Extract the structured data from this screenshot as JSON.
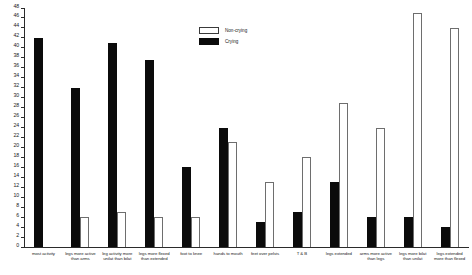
{
  "chart_data": {
    "type": "bar",
    "title": "",
    "xlabel": "",
    "ylabel": "",
    "ylim": [
      0,
      48
    ],
    "ytick_step": 2,
    "grid": false,
    "legend_position": "top-center",
    "yticks": [
      "0",
      "2",
      "4",
      "6",
      "8",
      "10",
      "12",
      "14",
      "16",
      "18",
      "20",
      "22",
      "24",
      "26",
      "28",
      "30",
      "32",
      "34",
      "36",
      "38",
      "40",
      "42",
      "44",
      "46",
      "48"
    ],
    "categories": [
      "most activity",
      "legs more active than arms",
      "leg activity more unilat than bilat",
      "legs more flexed than extended",
      "foot to knee",
      "hands to mouth",
      "feet over pelvis",
      "T & B",
      "legs extended",
      "arms more active than legs",
      "legs more bilat than unilat",
      "legs extended more than flexed"
    ],
    "series": [
      {
        "name": "Non-crying",
        "color": "#ffffff",
        "values": [
          0.5,
          6,
          7,
          6,
          6,
          21,
          13,
          18,
          29,
          24,
          47,
          44
        ]
      },
      {
        "name": "Crying",
        "color": "#0b0b0b",
        "values": [
          42,
          32,
          41,
          37.5,
          16,
          24,
          5,
          7,
          13,
          6,
          6,
          4
        ]
      }
    ]
  },
  "legend": {
    "items": [
      {
        "label": "Non-crying",
        "style": "noncrying"
      },
      {
        "label": "Crying",
        "style": "crying"
      }
    ]
  }
}
